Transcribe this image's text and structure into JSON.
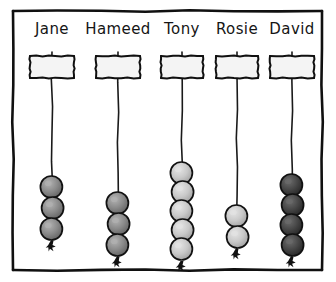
{
  "figure": {
    "frame_color": "#101010",
    "background_color": "#ffffff",
    "thread_color": "#1a1a1a"
  },
  "bead_palette": {
    "light": "#c9c9c9",
    "light_shade": "#ababab",
    "light_highlight": "#e2e2e2",
    "medium": "#8a8a8a",
    "medium_shade": "#6e6e6e",
    "medium_highlight": "#b0b0b0",
    "dark": "#464646",
    "dark_shade": "#2e2e2e",
    "dark_highlight": "#6a6a6a",
    "outline": "#111111"
  },
  "columns": [
    {
      "name": "Jane",
      "label_x": 52,
      "label_y": 34,
      "hanger_x": 30,
      "hanger_y": 56,
      "hanger_w": 44,
      "hanger_h": 22,
      "thread_x": 52,
      "thread_top": 52,
      "thread_bottom": 243,
      "bead_count": 3,
      "bead_shade": "medium",
      "first_bead_cy": 187,
      "bead_spacing": 21,
      "bead_r": 11
    },
    {
      "name": "Hameed",
      "label_x": 118,
      "label_y": 34,
      "hanger_x": 96,
      "hanger_y": 56,
      "hanger_w": 44,
      "hanger_h": 22,
      "thread_x": 118,
      "thread_top": 52,
      "thread_bottom": 263,
      "bead_count": 3,
      "bead_shade": "medium",
      "first_bead_cy": 203,
      "bead_spacing": 21,
      "bead_r": 11
    },
    {
      "name": "Tony",
      "label_x": 182,
      "label_y": 34,
      "hanger_x": 161,
      "hanger_y": 56,
      "hanger_w": 42,
      "hanger_h": 22,
      "thread_x": 182,
      "thread_top": 52,
      "thread_bottom": 258,
      "bead_count": 5,
      "bead_shade": "light",
      "first_bead_cy": 173,
      "bead_spacing": 19,
      "bead_r": 11
    },
    {
      "name": "Rosie",
      "label_x": 237,
      "label_y": 34,
      "hanger_x": 216,
      "hanger_y": 56,
      "hanger_w": 42,
      "hanger_h": 22,
      "thread_x": 237,
      "thread_top": 52,
      "thread_bottom": 253,
      "bead_count": 2,
      "bead_shade": "light",
      "first_bead_cy": 216,
      "bead_spacing": 21,
      "bead_r": 11
    },
    {
      "name": "David",
      "label_x": 292,
      "label_y": 34,
      "hanger_x": 270,
      "hanger_y": 56,
      "hanger_w": 44,
      "hanger_h": 22,
      "thread_x": 292,
      "thread_top": 52,
      "thread_bottom": 258,
      "bead_count": 4,
      "bead_shade": "dark",
      "first_bead_cy": 185,
      "bead_spacing": 20,
      "bead_r": 11
    }
  ],
  "frame": {
    "x": 13,
    "y": 11,
    "width": 309,
    "height": 259
  }
}
